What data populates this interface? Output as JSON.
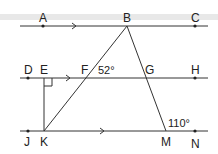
{
  "figure": {
    "points": {
      "A": "A",
      "B": "B",
      "C": "C",
      "D": "D",
      "E": "E",
      "F": "F",
      "G": "G",
      "H": "H",
      "J": "J",
      "K": "K",
      "M": "M",
      "N": "N"
    },
    "angles": {
      "angle_F": "52°",
      "angle_M": "110°"
    },
    "line_color": "#333333"
  }
}
